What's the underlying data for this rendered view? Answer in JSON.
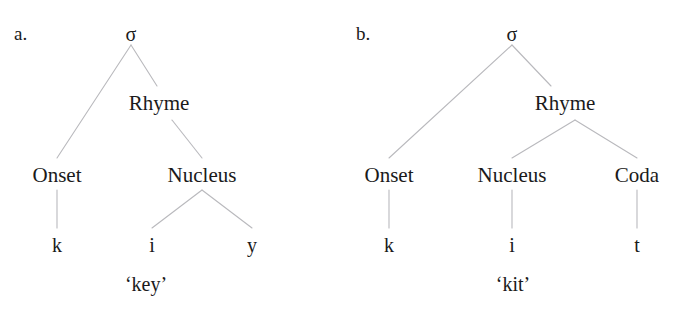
{
  "figure": {
    "clipped_header_fragment": "—",
    "line_color": "#b9b9bd",
    "text_color": "#1a1a1a",
    "background": "#ffffff"
  },
  "trees": [
    {
      "enumerator": "a.",
      "root": "σ",
      "rhyme": "Rhyme",
      "constituents": [
        "Onset",
        "Nucleus"
      ],
      "segments": [
        "k",
        "i",
        "y"
      ],
      "gloss": "‘key’"
    },
    {
      "enumerator": "b.",
      "root": "σ",
      "rhyme": "Rhyme",
      "constituents": [
        "Onset",
        "Nucleus",
        "Coda"
      ],
      "segments": [
        "k",
        "i",
        "t"
      ],
      "gloss": "‘kit’"
    }
  ]
}
